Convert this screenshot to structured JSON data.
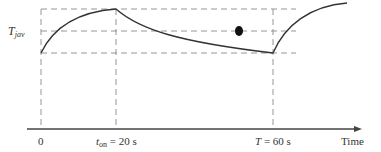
{
  "diagram": {
    "title": "",
    "y_label": {
      "main": "T",
      "subscript": "jav"
    },
    "x_axis_label": "Time",
    "ticks": [
      {
        "id": "zero",
        "t_seconds": 0,
        "label_main": "0",
        "label_sub": "",
        "label_suffix": ""
      },
      {
        "id": "ton",
        "t_seconds": 20,
        "label_main": "t",
        "label_sub": "on",
        "label_suffix": " = 20 s"
      },
      {
        "id": "period",
        "t_seconds": 60,
        "label_main": "T",
        "label_sub": "",
        "label_suffix": " = 60 s"
      }
    ],
    "levels": {
      "max": "T max",
      "avg": "T jav",
      "min": "T min"
    },
    "curve_phases": [
      {
        "name": "heating",
        "from_s": 0,
        "to_s": 20,
        "from_level": "min",
        "to_level": "max"
      },
      {
        "name": "cooling",
        "from_s": 20,
        "to_s": 60,
        "from_level": "max",
        "to_level": "min"
      },
      {
        "name": "heating",
        "from_s": 60,
        "to_s": 80,
        "from_level": "min",
        "to_level": "max"
      }
    ],
    "colors": {
      "curve": "#333333",
      "dashed": "#888888",
      "axis": "#444444",
      "dot": "#111111"
    }
  }
}
